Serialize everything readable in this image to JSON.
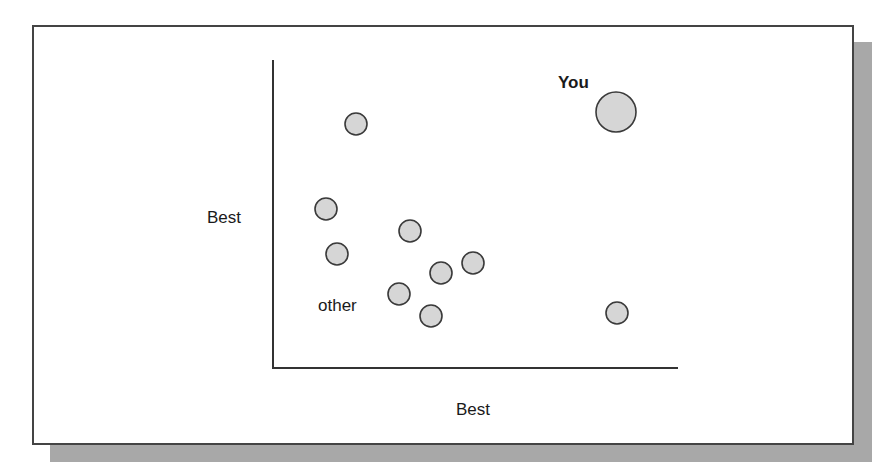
{
  "chart_data": {
    "type": "scatter",
    "title": "",
    "xlabel": "Best",
    "ylabel": "Best",
    "grid": false,
    "legend": null,
    "axes": {
      "x_axis_px": [
        273,
        678
      ],
      "y_axis_px": [
        60,
        368
      ],
      "origin_px": [
        273,
        368
      ]
    },
    "series": [
      {
        "name": "You",
        "label": "You",
        "points": [
          {
            "cx": 616,
            "cy": 112,
            "r": 20
          }
        ]
      },
      {
        "name": "other",
        "label": "other",
        "points": [
          {
            "cx": 356,
            "cy": 124,
            "r": 11
          },
          {
            "cx": 326,
            "cy": 209,
            "r": 11
          },
          {
            "cx": 410,
            "cy": 231,
            "r": 11
          },
          {
            "cx": 337,
            "cy": 254,
            "r": 11
          },
          {
            "cx": 473,
            "cy": 263,
            "r": 11
          },
          {
            "cx": 441,
            "cy": 273,
            "r": 11
          },
          {
            "cx": 399,
            "cy": 294,
            "r": 11
          },
          {
            "cx": 431,
            "cy": 316,
            "r": 11
          },
          {
            "cx": 617,
            "cy": 313,
            "r": 11
          }
        ]
      }
    ],
    "colors": {
      "marker_fill": "#d6d6d6",
      "marker_stroke": "#3a3a3a",
      "axis": "#333333",
      "shadow": "#a8a8a8"
    }
  },
  "labels": {
    "you": "You",
    "other": "other",
    "y_axis": "Best",
    "x_axis": "Best"
  }
}
